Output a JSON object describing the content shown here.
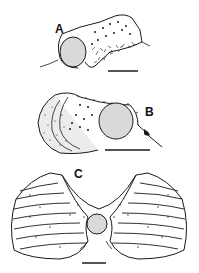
{
  "figure": {
    "panels": [
      {
        "label": "A",
        "description": "cylindrical tube with oval aperture and spiny exterior"
      },
      {
        "label": "B",
        "description": "tube with curled lip, round aperture and spines"
      },
      {
        "label": "C",
        "description": "butterfly-shaped section with radiating lamellae around central round opening"
      }
    ],
    "scale_bars": 3,
    "colors": {
      "ink": "#1a1a1a",
      "fill": "#d9d9d9",
      "background": "#ffffff"
    }
  }
}
